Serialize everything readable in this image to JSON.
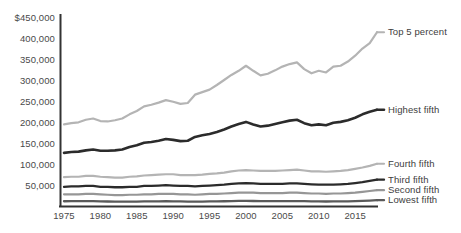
{
  "chart_data": {
    "type": "line",
    "title": "",
    "subtitle": "",
    "xlabel": "",
    "ylabel": "",
    "xlim": [
      1975,
      2018
    ],
    "ylim": [
      0,
      450000
    ],
    "grid": false,
    "legend_position": "right-inline",
    "y_ticks": [
      "$450,000",
      "400,000",
      "350,000",
      "300,000",
      "250,000",
      "200,000",
      "150,000",
      "100,000",
      "50,000"
    ],
    "y_tick_values": [
      450000,
      400000,
      350000,
      300000,
      250000,
      200000,
      150000,
      100000,
      50000
    ],
    "x_ticks": [
      "1975",
      "1980",
      "1985",
      "1990",
      "1995",
      "2000",
      "2005",
      "2010",
      "2015"
    ],
    "x_tick_values": [
      1975,
      1980,
      1985,
      1990,
      1995,
      2000,
      2005,
      2010,
      2015
    ],
    "x": [
      1975,
      1976,
      1977,
      1978,
      1979,
      1980,
      1981,
      1982,
      1983,
      1984,
      1985,
      1986,
      1987,
      1988,
      1989,
      1990,
      1991,
      1992,
      1993,
      1994,
      1995,
      1996,
      1997,
      1998,
      1999,
      2000,
      2001,
      2002,
      2003,
      2004,
      2005,
      2006,
      2007,
      2008,
      2009,
      2010,
      2011,
      2012,
      2013,
      2014,
      2015,
      2016,
      2017,
      2018
    ],
    "series": [
      {
        "name": "Top 5 percent",
        "color": "#b4b4b4",
        "width": 2.2,
        "label": "Top 5 percent",
        "label_value": 416000,
        "values": [
          196000,
          199000,
          201000,
          207000,
          210000,
          204000,
          203000,
          206000,
          210000,
          220000,
          228000,
          239000,
          243000,
          248000,
          254000,
          250000,
          245000,
          247000,
          267000,
          273000,
          279000,
          290000,
          302000,
          314000,
          324000,
          336000,
          324000,
          313000,
          317000,
          325000,
          334000,
          340000,
          344000,
          328000,
          318000,
          324000,
          320000,
          334000,
          336000,
          346000,
          360000,
          377000,
          390000,
          416000
        ]
      },
      {
        "name": "Highest fifth",
        "color": "#2b2b2b",
        "width": 2.6,
        "label": "Highest fifth",
        "label_value": 231000,
        "values": [
          128000,
          130000,
          131000,
          134000,
          136000,
          133000,
          133000,
          134000,
          136000,
          142000,
          146000,
          152000,
          154000,
          157000,
          161000,
          159000,
          156000,
          157000,
          166000,
          170000,
          173000,
          178000,
          184000,
          191000,
          197000,
          202000,
          196000,
          191000,
          193000,
          197000,
          201000,
          205000,
          207000,
          199000,
          194000,
          196000,
          194000,
          200000,
          202000,
          206000,
          212000,
          220000,
          226000,
          231000
        ]
      },
      {
        "name": "Fourth fifth",
        "color": "#b4b4b4",
        "width": 2.2,
        "label": "Fourth fifth",
        "label_value": 102000,
        "values": [
          70000,
          71000,
          71000,
          73000,
          73000,
          71000,
          70000,
          69000,
          69000,
          71000,
          72000,
          74000,
          75000,
          76000,
          77000,
          77000,
          75000,
          75000,
          75000,
          76000,
          78000,
          79000,
          81000,
          84000,
          86000,
          87000,
          86000,
          85000,
          85000,
          85000,
          86000,
          87000,
          88000,
          86000,
          84000,
          84000,
          83000,
          84000,
          85000,
          87000,
          90000,
          93000,
          97000,
          102000
        ]
      },
      {
        "name": "Third fifth",
        "color": "#2b2b2b",
        "width": 2.3,
        "label": "Third fifth",
        "label_value": 64000,
        "values": [
          47000,
          48000,
          48000,
          49000,
          49000,
          47000,
          47000,
          46000,
          46000,
          47000,
          47000,
          49000,
          49000,
          50000,
          51000,
          50000,
          49000,
          49000,
          48000,
          49000,
          50000,
          51000,
          52000,
          54000,
          55000,
          56000,
          55000,
          54000,
          54000,
          54000,
          54000,
          55000,
          55000,
          54000,
          53000,
          52000,
          52000,
          52000,
          53000,
          54000,
          56000,
          58000,
          61000,
          64000
        ]
      },
      {
        "name": "Second fifth",
        "color": "#969696",
        "width": 2.2,
        "label": "Second fifth",
        "label_value": 39000,
        "values": [
          29000,
          29000,
          29000,
          30000,
          30000,
          29000,
          28000,
          27000,
          27000,
          28000,
          28000,
          29000,
          29000,
          30000,
          30000,
          30000,
          29000,
          29000,
          28000,
          29000,
          30000,
          30000,
          31000,
          32000,
          33000,
          33000,
          33000,
          32000,
          32000,
          32000,
          32000,
          33000,
          33000,
          32000,
          31000,
          31000,
          30000,
          31000,
          31000,
          32000,
          33000,
          35000,
          37000,
          39000
        ]
      },
      {
        "name": "Lowest fifth",
        "color": "#5a5a5a",
        "width": 2.3,
        "label": "Lowest fifth",
        "label_value": 15000,
        "values": [
          12500,
          12600,
          12600,
          12800,
          12800,
          12300,
          11900,
          11500,
          11400,
          11700,
          11800,
          12100,
          12200,
          12400,
          12600,
          12400,
          12000,
          11800,
          11500,
          11800,
          12100,
          12200,
          12500,
          12900,
          13200,
          13300,
          13100,
          12800,
          12700,
          12700,
          12700,
          12900,
          12900,
          12600,
          12300,
          12100,
          11900,
          12000,
          12200,
          12400,
          12900,
          13500,
          14200,
          15000
        ]
      }
    ]
  },
  "axis": {
    "y_axis_color": "#333333",
    "x_axis_color": "#333333"
  }
}
